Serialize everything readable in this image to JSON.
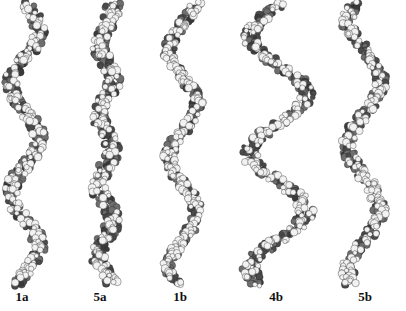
{
  "figure": {
    "background": "#ffffff",
    "atom_colors": {
      "carbon": "#6e6e6e",
      "carbon_dark": "#4a4a4a",
      "hydrogen": "#f2f2f2",
      "heteroatom": "#3a3a3a",
      "outline": "#2a2a2a"
    },
    "helices": [
      {
        "id": "1a",
        "label": "1a",
        "center_x": 25,
        "amplitude": 14,
        "turns": 2.6,
        "width": 22,
        "label_x": 22
      },
      {
        "id": "5a",
        "label": "5a",
        "center_x": 106,
        "amplitude": 7,
        "turns": 4.0,
        "width": 26,
        "label_x": 100
      },
      {
        "id": "1b",
        "label": "1b",
        "center_x": 183,
        "amplitude": 14,
        "turns": 2.6,
        "width": 20,
        "label_x": 180
      },
      {
        "id": "4b",
        "label": "4b",
        "center_x": 278,
        "amplitude": 28,
        "turns": 2.4,
        "width": 26,
        "label_x": 276
      },
      {
        "id": "5b",
        "label": "5b",
        "center_x": 364,
        "amplitude": 16,
        "turns": 2.2,
        "width": 22,
        "label_x": 365
      }
    ],
    "labels": [
      "1a",
      "5a",
      "1b",
      "4b",
      "5b"
    ]
  }
}
